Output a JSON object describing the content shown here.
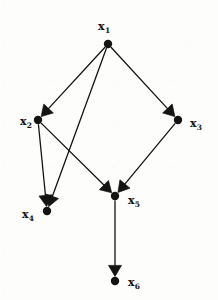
{
  "figure": {
    "kind": "directed-graph",
    "title": "",
    "background_color": "#fdfdfb",
    "ink_color": "#141414",
    "width": 218,
    "height": 300
  },
  "graph_data": {
    "type": "diagram",
    "directed": true,
    "node_radius": 4.2,
    "edge_width": 1.3,
    "arrow_length": 11,
    "arrow_half_width": 6.5,
    "nodes": [
      {
        "id": "x1",
        "label_base": "x",
        "label_sub": "1",
        "x": 108,
        "y": 44,
        "label_x": 104,
        "label_y": 21,
        "label_anchor": "center"
      },
      {
        "id": "x2",
        "label_base": "x",
        "label_sub": "2",
        "x": 38,
        "y": 120,
        "label_x": 20,
        "label_y": 116,
        "label_anchor": "left"
      },
      {
        "id": "x3",
        "label_base": "x",
        "label_sub": "3",
        "x": 178,
        "y": 120,
        "label_x": 190,
        "label_y": 118,
        "label_anchor": "left"
      },
      {
        "id": "x4",
        "label_base": "x",
        "label_sub": "4",
        "x": 47,
        "y": 211,
        "label_x": 22,
        "label_y": 209,
        "label_anchor": "left"
      },
      {
        "id": "x5",
        "label_base": "x",
        "label_sub": "5",
        "x": 115,
        "y": 196,
        "label_x": 128,
        "label_y": 195,
        "label_anchor": "left"
      },
      {
        "id": "x6",
        "label_base": "x",
        "label_sub": "6",
        "x": 115,
        "y": 281,
        "label_x": 128,
        "label_y": 277,
        "label_anchor": "left"
      }
    ],
    "edges": [
      {
        "id": "e1",
        "from": "x1",
        "to": "x2",
        "arrow": true
      },
      {
        "id": "e2",
        "from": "x1",
        "to": "x3",
        "arrow": true
      },
      {
        "id": "e3",
        "from": "x1",
        "to": "x4",
        "arrow": true
      },
      {
        "id": "e4",
        "from": "x2",
        "to": "x4",
        "arrow": true
      },
      {
        "id": "e5",
        "from": "x2",
        "to": "x5",
        "arrow": true
      },
      {
        "id": "e6",
        "from": "x3",
        "to": "x5",
        "arrow": true
      },
      {
        "id": "e7",
        "from": "x5",
        "to": "x6",
        "arrow": true
      }
    ]
  }
}
